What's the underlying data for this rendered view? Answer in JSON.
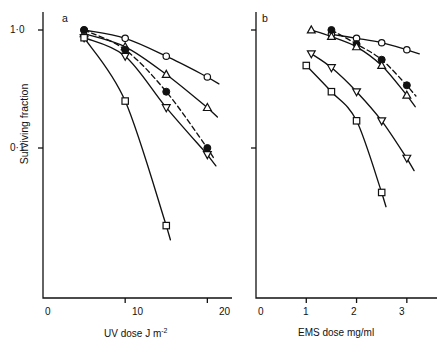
{
  "figure": {
    "panels": [
      {
        "id": "a",
        "letter": "a",
        "xlabel_main": "UV dose J  m",
        "xlabel_sup": "-2",
        "xticks": [
          "0",
          "10",
          "20"
        ],
        "xtick_values": [
          0,
          10,
          20
        ]
      },
      {
        "id": "b",
        "letter": "b",
        "xlabel_main": "EMS dose  mg/ml",
        "xlabel_sup": "",
        "xticks": [
          "0",
          "1",
          "2",
          "3"
        ],
        "xtick_values": [
          0,
          1,
          2,
          3
        ]
      }
    ],
    "ylabel": "Surviving fraction",
    "yticks": [
      "1·0",
      "0·1"
    ],
    "ytick_values": [
      1.0,
      0.1
    ],
    "colors": {
      "ink": "#111111",
      "background": "#ffffff"
    }
  },
  "chart_data": [
    {
      "type": "line",
      "title": "a",
      "xlabel": "UV dose J m-2",
      "ylabel": "Surviving fraction",
      "yscale": "log",
      "xlim": [
        0,
        23
      ],
      "ylim": [
        0.012,
        1.3
      ],
      "grid": false,
      "legend": "none",
      "series": [
        {
          "name": "open-circle",
          "marker": "open-circle",
          "linestyle": "solid",
          "x": [
            5,
            10,
            15,
            20
          ],
          "y": [
            1.0,
            0.85,
            0.6,
            0.4
          ]
        },
        {
          "name": "open-triangle-up",
          "marker": "open-triangle-up",
          "linestyle": "solid",
          "x": [
            5,
            10,
            15,
            20
          ],
          "y": [
            0.93,
            0.72,
            0.42,
            0.22
          ]
        },
        {
          "name": "filled-circle",
          "marker": "filled-circle",
          "linestyle": "dashed",
          "x": [
            5,
            10,
            15,
            20
          ],
          "y": [
            1.0,
            0.68,
            0.3,
            0.1
          ]
        },
        {
          "name": "open-triangle-down",
          "marker": "open-triangle-down",
          "linestyle": "solid",
          "x": [
            5,
            10,
            15,
            20
          ],
          "y": [
            0.86,
            0.6,
            0.22,
            0.088
          ]
        },
        {
          "name": "open-square",
          "marker": "open-square",
          "linestyle": "solid",
          "x": [
            5,
            10,
            15
          ],
          "y": [
            0.86,
            0.25,
            0.022
          ]
        }
      ]
    },
    {
      "type": "line",
      "title": "b",
      "xlabel": "EMS dose mg/ml",
      "ylabel": "Surviving fraction",
      "yscale": "log",
      "xlim": [
        0,
        3.6
      ],
      "ylim": [
        0.012,
        1.3
      ],
      "grid": false,
      "legend": "none",
      "series": [
        {
          "name": "open-circle",
          "marker": "open-circle",
          "linestyle": "solid",
          "x": [
            1.5,
            2.0,
            2.5,
            3.0
          ],
          "y": [
            0.92,
            0.85,
            0.78,
            0.68
          ]
        },
        {
          "name": "filled-circle",
          "marker": "filled-circle",
          "linestyle": "dashed",
          "x": [
            1.5,
            2.0,
            2.5,
            3.0
          ],
          "y": [
            1.0,
            0.76,
            0.56,
            0.34
          ]
        },
        {
          "name": "open-triangle-up",
          "marker": "open-triangle-up",
          "linestyle": "solid",
          "x": [
            1.1,
            1.5,
            2.0,
            2.5,
            3.0
          ],
          "y": [
            1.0,
            0.88,
            0.72,
            0.5,
            0.28
          ]
        },
        {
          "name": "open-triangle-down",
          "marker": "open-triangle-down",
          "linestyle": "solid",
          "x": [
            1.1,
            1.5,
            2.0,
            2.5,
            3.0
          ],
          "y": [
            0.63,
            0.48,
            0.3,
            0.17,
            0.082
          ]
        },
        {
          "name": "open-square",
          "marker": "open-square",
          "linestyle": "solid",
          "x": [
            1.0,
            1.5,
            2.0,
            2.5
          ],
          "y": [
            0.5,
            0.3,
            0.17,
            0.042
          ]
        }
      ]
    }
  ]
}
